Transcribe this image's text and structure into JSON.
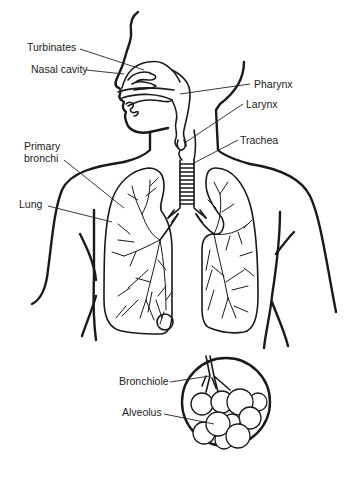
{
  "diagram": {
    "labels": {
      "turbinates": "Turbinates",
      "nasal_cavity": "Nasal cavity",
      "pharynx": "Pharynx",
      "larynx": "Larynx",
      "trachea": "Trachea",
      "primary_bronchi_line1": "Primary",
      "primary_bronchi_line2": "bronchi",
      "lung": "Lung",
      "bronchiole": "Bronchiole",
      "alveolus": "Alveolus"
    },
    "colors": {
      "ink": "#1a1a1a",
      "background": "#ffffff"
    }
  }
}
